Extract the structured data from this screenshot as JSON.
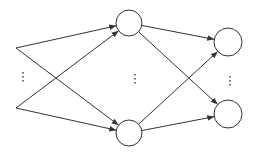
{
  "diagram": {
    "type": "neural-network",
    "stroke_color": "#333333",
    "fill_color": "#ffffff",
    "inputs": [
      {
        "id": "in1",
        "x": 16,
        "y": 48
      },
      {
        "id": "in2",
        "x": 16,
        "y": 108
      }
    ],
    "hidden": [
      {
        "id": "h1",
        "x": 129,
        "y": 23,
        "r": 13
      },
      {
        "id": "h2",
        "x": 129,
        "y": 133,
        "r": 13
      }
    ],
    "outputs": [
      {
        "id": "o1",
        "x": 228,
        "y": 42,
        "r": 14
      },
      {
        "id": "o2",
        "x": 228,
        "y": 114,
        "r": 14
      }
    ],
    "ellipses": [
      {
        "layer": "input",
        "x": 23,
        "y": 76,
        "text": "⋮"
      },
      {
        "layer": "hidden",
        "x": 135,
        "y": 78,
        "text": "⋮"
      },
      {
        "layer": "output",
        "x": 230,
        "y": 80,
        "text": "⋮"
      }
    ],
    "edges": [
      {
        "from": "in1",
        "to": "h1"
      },
      {
        "from": "in1",
        "to": "h2"
      },
      {
        "from": "in2",
        "to": "h1"
      },
      {
        "from": "in2",
        "to": "h2"
      },
      {
        "from": "h1",
        "to": "o1"
      },
      {
        "from": "h1",
        "to": "o2"
      },
      {
        "from": "h2",
        "to": "o1"
      },
      {
        "from": "h2",
        "to": "o2"
      }
    ]
  }
}
